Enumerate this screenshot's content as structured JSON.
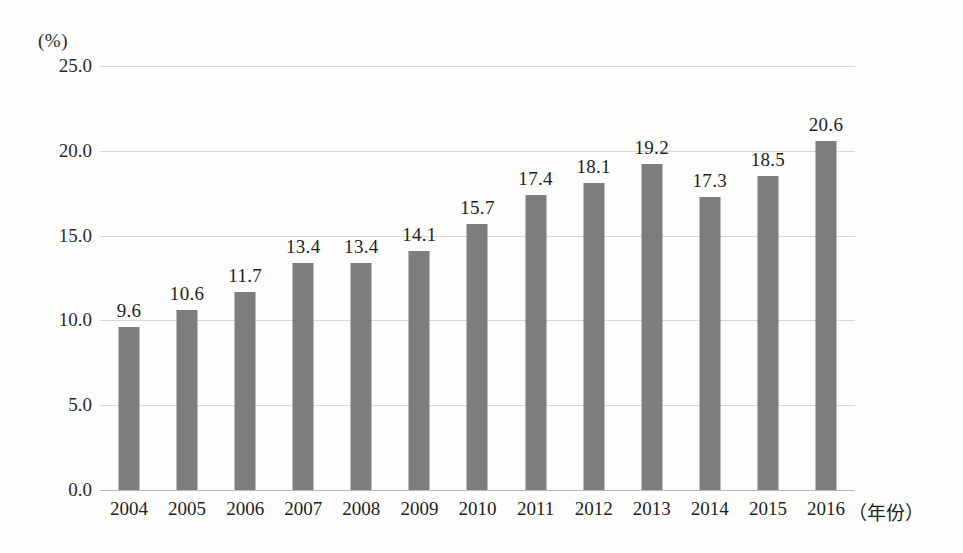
{
  "chart_data": {
    "type": "bar",
    "title": "",
    "subtitle": "",
    "xlabel": "（年份）",
    "ylabel": "(%)",
    "categories": [
      "2004",
      "2005",
      "2006",
      "2007",
      "2008",
      "2009",
      "2010",
      "2011",
      "2012",
      "2013",
      "2014",
      "2015",
      "2016"
    ],
    "values": [
      9.6,
      10.6,
      11.7,
      13.4,
      13.4,
      14.1,
      15.7,
      17.4,
      18.1,
      19.2,
      17.3,
      18.5,
      20.6
    ],
    "value_labels": [
      "9.6",
      "10.6",
      "11.7",
      "13.4",
      "13.4",
      "14.1",
      "15.7",
      "17.4",
      "18.1",
      "19.2",
      "17.3",
      "18.5",
      "20.6"
    ],
    "ylim": [
      0.0,
      25.0
    ],
    "ytick_values": [
      0.0,
      5.0,
      10.0,
      15.0,
      20.0,
      25.0
    ],
    "ytick_labels": [
      "0.0",
      "5.0",
      "10.0",
      "15.0",
      "20.0",
      "25.0"
    ],
    "grid": true,
    "grid_axis": "y",
    "legend": false,
    "legend_position": "none",
    "bar_color": "#7d7d7d",
    "grid_color": "#d8d8d8",
    "axis_color": "#b8b8b8",
    "background_color": "#fdfdfc",
    "text_color": "#1e1e1e"
  }
}
